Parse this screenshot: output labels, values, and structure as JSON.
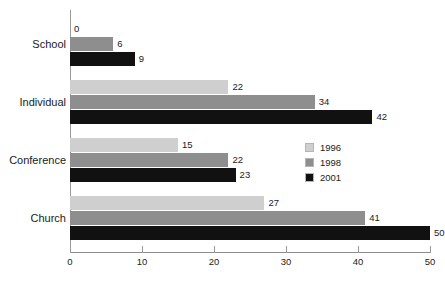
{
  "chart_data": {
    "type": "bar",
    "orientation": "horizontal",
    "title": "",
    "xlabel": "",
    "ylabel": "",
    "categories": [
      "School",
      "Individual",
      "Conference",
      "Church"
    ],
    "series": [
      {
        "name": "1996",
        "color": "#cfcfcf",
        "values": [
          0,
          22,
          15,
          27
        ]
      },
      {
        "name": "1998",
        "color": "#8e8e8e",
        "values": [
          6,
          34,
          22,
          41
        ]
      },
      {
        "name": "2001",
        "color": "#111111",
        "values": [
          9,
          42,
          23,
          50
        ]
      }
    ],
    "xlim": [
      0,
      50
    ],
    "xticks": [
      0,
      10,
      20,
      30,
      40,
      50
    ],
    "xtick_labels": [
      "0",
      "10",
      "20",
      "30",
      "40",
      "50"
    ],
    "grid": false,
    "data_labels": true,
    "legend_position": "middle-right",
    "legend_entries": [
      "1996",
      "1998",
      "2001"
    ]
  }
}
